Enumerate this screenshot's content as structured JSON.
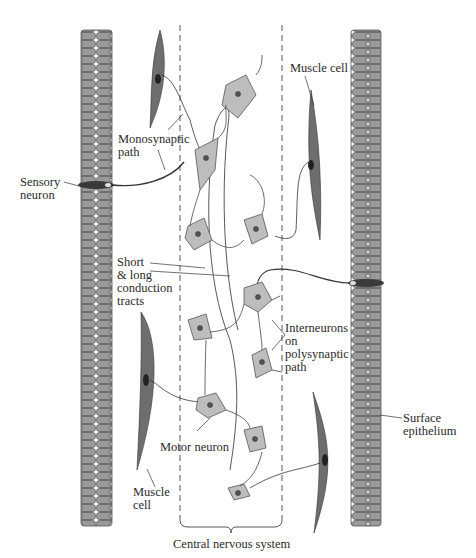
{
  "labels": {
    "monosynaptic": "Monosynaptic\npath",
    "sensory": "Sensory\nneuron",
    "short_long": "Short\n& long\nconduction\ntracts",
    "muscle_cell_top": "Muscle cell",
    "interneurons": "Interneurons\non\npolysynaptic\npath",
    "surface": "Surface\nepithelium",
    "motor": "Motor neuron",
    "muscle_cell_bottom": "Muscle\ncell",
    "cns": "Central nervous system"
  },
  "colors": {
    "epithelium_fill": "#9a9a9a",
    "epithelium_stroke": "#555555",
    "muscle_fill": "#6e6e6e",
    "neuron_fill": "#bdbdbd",
    "line": "#3a3a3a",
    "text": "#2a2a2a"
  }
}
